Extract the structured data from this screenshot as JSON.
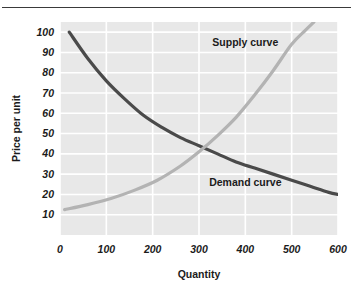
{
  "figure": {
    "background_color": "#ffffff",
    "rule_color": "#3a3a3a",
    "plot_background": "#e8e8e8",
    "gridline_color": "#ffffff"
  },
  "chart_data": {
    "type": "line",
    "title": "",
    "subtitle": "",
    "xlabel": "Quantity",
    "ylabel": "Price per unit",
    "xlim": [
      0,
      600
    ],
    "ylim": [
      0,
      105
    ],
    "xticks": [
      0,
      100,
      200,
      300,
      400,
      500,
      600
    ],
    "xtick_labels": [
      "0",
      "100",
      "200",
      "300",
      "400",
      "500",
      "600"
    ],
    "yticks": [
      10,
      20,
      30,
      40,
      50,
      60,
      70,
      80,
      90,
      100
    ],
    "ytick_labels": [
      "10",
      "20",
      "30",
      "40",
      "50",
      "60",
      "70",
      "80",
      "90",
      "100"
    ],
    "grid": true,
    "grid_axis": "both",
    "legend": "inline-annotations",
    "equilibrium": {
      "quantity": 290,
      "price": 45
    },
    "series": [
      {
        "name": "Demand curve",
        "color": "#4a4a4a",
        "line_width": 3.2,
        "label_text": "Demand curve",
        "label_x": 400,
        "label_y": 26,
        "x": [
          20,
          60,
          100,
          140,
          180,
          220,
          260,
          300,
          340,
          380,
          420,
          460,
          500,
          540,
          580,
          600
        ],
        "y": [
          100,
          87,
          76,
          67,
          59,
          53,
          48,
          44,
          40,
          36,
          33,
          30,
          27,
          24,
          21,
          20
        ]
      },
      {
        "name": "Supply curve",
        "color": "#b3b3b3",
        "line_width": 3.2,
        "label_text": "Supply curve",
        "label_x": 400,
        "label_y": 95,
        "x": [
          10,
          60,
          110,
          160,
          210,
          260,
          300,
          340,
          380,
          420,
          460,
          500,
          530,
          548
        ],
        "y": [
          12.5,
          15,
          18,
          22,
          27,
          34,
          41,
          49,
          58,
          69,
          81,
          94,
          101,
          105
        ]
      }
    ],
    "annotations": [
      {
        "text": "Supply curve",
        "x": 400,
        "y": 95
      },
      {
        "text": "Demand curve",
        "x": 400,
        "y": 26
      }
    ]
  },
  "axes": {
    "x_axis_title": "Quantity",
    "y_axis_title": "Price per unit"
  }
}
